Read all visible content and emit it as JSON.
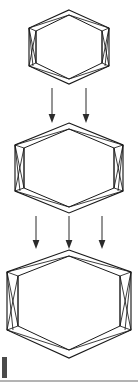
{
  "figure": {
    "title": "Hexagonal cage transformation sequence",
    "background_color": "#ffffff",
    "stroke_color": "#1a1a1a",
    "arrow_color": "#2b2b2b",
    "rule_color": "#9a9a9a",
    "width": 138,
    "height": 390,
    "stage_count": 3,
    "arrow_group_count": 2
  },
  "stages": [
    {
      "id": "stage-1",
      "label": "Hexagon stage 1 (small)",
      "center_x": 69,
      "center_y": 47,
      "outer_radius_x": 40,
      "outer_radius_y": 37,
      "inner_inset": 7,
      "scale": "small"
    },
    {
      "id": "stage-2",
      "label": "Hexagon stage 2 (medium)",
      "center_x": 69,
      "center_y": 168,
      "outer_radius_x": 54,
      "outer_radius_y": 45,
      "inner_inset": 9,
      "scale": "medium"
    },
    {
      "id": "stage-3",
      "label": "Hexagon stage 3 (large)",
      "center_x": 69,
      "center_y": 301,
      "outer_radius_x": 62,
      "outer_radius_y": 57,
      "inner_inset": 11,
      "scale": "large"
    }
  ],
  "arrow_groups": [
    {
      "id": "arrow-group-1",
      "label": "Transition arrows stage 1 to stage 2",
      "count": 2,
      "x_positions": [
        52,
        86
      ],
      "y_start": 88,
      "y_end": 122
    },
    {
      "id": "arrow-group-2",
      "label": "Transition arrows stage 2 to stage 3",
      "count": 3,
      "x_positions": [
        36,
        69,
        102
      ],
      "y_start": 216,
      "y_end": 248
    }
  ],
  "footer": {
    "rule_y": 381,
    "rule_x_start": 0,
    "rule_x_end": 138,
    "corner_mark_x": 2,
    "corner_mark_y": 357,
    "corner_mark_width": 5,
    "corner_mark_height": 21
  }
}
